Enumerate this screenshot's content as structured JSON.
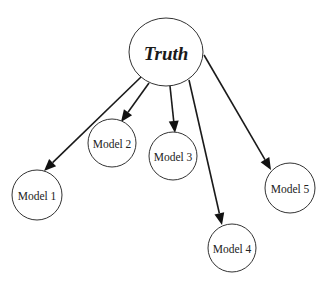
{
  "diagram": {
    "type": "tree",
    "root": {
      "id": "truth",
      "label": "Truth",
      "cx": 166,
      "cy": 52,
      "rx": 37,
      "ry": 34
    },
    "nodes": [
      {
        "id": "model1",
        "label": "Model 1",
        "cx": 37,
        "cy": 195,
        "r": 25
      },
      {
        "id": "model2",
        "label": "Model 2",
        "cx": 112,
        "cy": 143,
        "r": 24
      },
      {
        "id": "model3",
        "label": "Model 3",
        "cx": 173,
        "cy": 156,
        "r": 24
      },
      {
        "id": "model4",
        "label": "Model 4",
        "cx": 232,
        "cy": 248,
        "r": 24
      },
      {
        "id": "model5",
        "label": "Model 5",
        "cx": 290,
        "cy": 188,
        "r": 25
      }
    ],
    "edges": [
      {
        "from": "truth",
        "to": "model1",
        "x1": 141,
        "y1": 77,
        "x2": 44,
        "y2": 171
      },
      {
        "from": "truth",
        "to": "model2",
        "x1": 149,
        "y1": 83,
        "x2": 121,
        "y2": 122
      },
      {
        "from": "truth",
        "to": "model3",
        "x1": 170,
        "y1": 86,
        "x2": 175,
        "y2": 133
      },
      {
        "from": "truth",
        "to": "model4",
        "x1": 189,
        "y1": 80,
        "x2": 222,
        "y2": 225
      },
      {
        "from": "truth",
        "to": "model5",
        "x1": 204,
        "y1": 55,
        "x2": 271,
        "y2": 170
      }
    ],
    "colors": {
      "stroke": "#333333",
      "edge": "#1a1a1a",
      "background": "#ffffff"
    }
  }
}
